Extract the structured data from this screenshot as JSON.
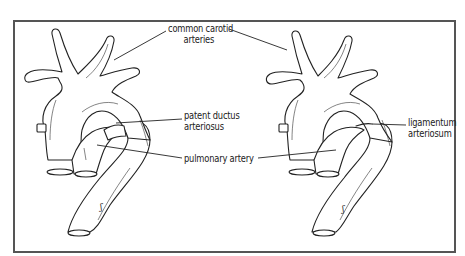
{
  "figure": {
    "left_panel": {
      "name": "before birth",
      "labels": {
        "common_carotid_line1": "common carotid",
        "common_carotid_line2": "arteries",
        "patent_ductus_line1": "patent ductus",
        "patent_ductus_line2": "arteriosus",
        "pulmonary_artery": "pulmonary artery"
      }
    },
    "right_panel": {
      "name": "after birth",
      "labels": {
        "ligamentum_line1": "ligamentum",
        "ligamentum_line2": "arteriosum"
      }
    },
    "colors": {
      "ink": "#222222",
      "frame": "#555555",
      "background": "#ffffff"
    }
  }
}
